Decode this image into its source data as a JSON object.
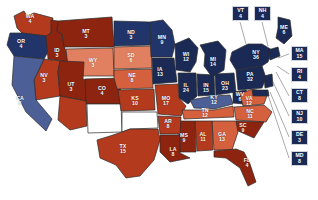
{
  "map": {
    "title": "2004 United States Presidential Election Electoral Map",
    "colors": {
      "dem_deep": "#1b2a55",
      "dem_mid": "#22356b",
      "dem_light": "#4c5f96",
      "rep_deep": "#8c2410",
      "rep_mid": "#b33a1c",
      "rep_light": "#d4603d",
      "rep_pale": "#e08060",
      "background": "#ffffff",
      "border": "#2b2b2b"
    },
    "legend": {
      "dem_label": "Democratic",
      "rep_label": "Republican"
    },
    "states": [
      {
        "abbr": "WA",
        "ev": "4",
        "party": "rep",
        "shade": "rep_mid",
        "x": 30,
        "y": 19
      },
      {
        "abbr": "OR",
        "ev": "4",
        "party": "dem",
        "shade": "dem_mid",
        "x": 21,
        "y": 44
      },
      {
        "abbr": "ID",
        "ev": "3",
        "party": "rep",
        "shade": "rep_deep",
        "x": 57,
        "y": 53
      },
      {
        "abbr": "MT",
        "ev": "3",
        "party": "rep",
        "shade": "rep_deep",
        "x": 86,
        "y": 34
      },
      {
        "abbr": "ND",
        "ev": "3",
        "party": "dem",
        "shade": "dem_mid",
        "x": 131,
        "y": 35
      },
      {
        "abbr": "SD",
        "ev": "6",
        "party": "rep",
        "shade": "rep_pale",
        "x": 131,
        "y": 58
      },
      {
        "abbr": "NE",
        "ev": "8",
        "party": "rep",
        "shade": "rep_light",
        "x": 132,
        "y": 78
      },
      {
        "abbr": "WY",
        "ev": "3",
        "party": "rep",
        "shade": "rep_pale",
        "x": 93,
        "y": 63
      },
      {
        "abbr": "NV",
        "ev": "3",
        "party": "rep",
        "shade": "rep_mid",
        "x": 44,
        "y": 78
      },
      {
        "abbr": "UT",
        "ev": "3",
        "party": "rep",
        "shade": "rep_deep",
        "x": 71,
        "y": 87
      },
      {
        "abbr": "CO",
        "ev": "4",
        "party": "rep",
        "shade": "rep_deep",
        "x": 102,
        "y": 91
      },
      {
        "abbr": "CA",
        "ev": "8",
        "party": "dem",
        "shade": "dem_light",
        "x": 20,
        "y": 101
      },
      {
        "abbr": "KS",
        "ev": "10",
        "party": "rep",
        "shade": "rep_mid",
        "x": 135,
        "y": 101
      },
      {
        "abbr": "MN",
        "ev": "9",
        "party": "dem",
        "shade": "dem_mid",
        "x": 162,
        "y": 40
      },
      {
        "abbr": "IA",
        "ev": "13",
        "party": "dem",
        "shade": "dem_deep",
        "x": 160,
        "y": 72
      },
      {
        "abbr": "WI",
        "ev": "12",
        "party": "dem",
        "shade": "dem_deep",
        "x": 186,
        "y": 57
      },
      {
        "abbr": "MI",
        "ev": "14",
        "party": "dem",
        "shade": "dem_deep",
        "x": 213,
        "y": 62
      },
      {
        "abbr": "IL",
        "ev": "24",
        "party": "dem",
        "shade": "dem_deep",
        "x": 186,
        "y": 88
      },
      {
        "abbr": "IN",
        "ev": "15",
        "party": "dem",
        "shade": "dem_deep",
        "x": 206,
        "y": 88
      },
      {
        "abbr": "OH",
        "ev": "23",
        "party": "dem",
        "shade": "dem_deep",
        "x": 225,
        "y": 86
      },
      {
        "abbr": "MO",
        "ev": "17",
        "party": "rep",
        "shade": "rep_mid",
        "x": 166,
        "y": 101
      },
      {
        "abbr": "KY",
        "ev": "12",
        "party": "dem",
        "shade": "dem_light",
        "x": 214,
        "y": 100
      },
      {
        "abbr": "WV",
        "ev": "6",
        "party": "dem",
        "shade": "dem_deep",
        "x": 240,
        "y": 97
      },
      {
        "abbr": "VA",
        "ev": "12",
        "party": "rep",
        "shade": "rep_light",
        "x": 249,
        "y": 101
      },
      {
        "abbr": "TN",
        "ev": "12",
        "party": "rep",
        "shade": "rep_light",
        "x": 205,
        "y": 113
      },
      {
        "abbr": "NC",
        "ev": "11",
        "party": "rep",
        "shade": "rep_light",
        "x": 250,
        "y": 114
      },
      {
        "abbr": "SC",
        "ev": "9",
        "party": "rep",
        "shade": "rep_deep",
        "x": 243,
        "y": 128
      },
      {
        "abbr": "GA",
        "ev": "13",
        "party": "rep",
        "shade": "rep_light",
        "x": 222,
        "y": 137
      },
      {
        "abbr": "AL",
        "ev": "11",
        "party": "rep",
        "shade": "rep_mid",
        "x": 203,
        "y": 137
      },
      {
        "abbr": "MS",
        "ev": "9",
        "party": "rep",
        "shade": "rep_deep",
        "x": 184,
        "y": 138
      },
      {
        "abbr": "AR",
        "ev": "8",
        "party": "rep",
        "shade": "rep_mid",
        "x": 168,
        "y": 124
      },
      {
        "abbr": "LA",
        "ev": "8",
        "party": "rep",
        "shade": "rep_deep",
        "x": 173,
        "y": 152
      },
      {
        "abbr": "FL",
        "ev": "4",
        "party": "rep",
        "shade": "rep_deep",
        "x": 247,
        "y": 163
      },
      {
        "abbr": "TX",
        "ev": "15",
        "party": "rep",
        "shade": "rep_mid",
        "x": 123,
        "y": 149
      },
      {
        "abbr": "NY",
        "ev": "36",
        "party": "dem",
        "shade": "dem_deep",
        "x": 256,
        "y": 55
      },
      {
        "abbr": "PA",
        "ev": "32",
        "party": "dem",
        "shade": "dem_deep",
        "x": 250,
        "y": 77
      },
      {
        "abbr": "ME",
        "ev": "6",
        "party": "dem",
        "shade": "dem_deep",
        "x": 284,
        "y": 30
      }
    ],
    "box_states": [
      {
        "abbr": "VT",
        "ev": "4",
        "party": "dem",
        "shade": "dem_deep",
        "x": 232,
        "y": 6
      },
      {
        "abbr": "NH",
        "ev": "4",
        "party": "dem",
        "shade": "dem_deep",
        "x": 254,
        "y": 6
      },
      {
        "abbr": "MA",
        "ev": "15",
        "party": "dem",
        "shade": "dem_deep",
        "x": 291,
        "y": 46
      },
      {
        "abbr": "RI",
        "ev": "4",
        "party": "dem",
        "shade": "dem_deep",
        "x": 291,
        "y": 67
      },
      {
        "abbr": "CT",
        "ev": "8",
        "party": "dem",
        "shade": "dem_deep",
        "x": 291,
        "y": 88
      },
      {
        "abbr": "NJ",
        "ev": "10",
        "party": "dem",
        "shade": "dem_deep",
        "x": 291,
        "y": 109
      },
      {
        "abbr": "DE",
        "ev": "3",
        "party": "dem",
        "shade": "dem_deep",
        "x": 291,
        "y": 130
      },
      {
        "abbr": "MD",
        "ev": "8",
        "party": "dem",
        "shade": "dem_deep",
        "x": 291,
        "y": 151
      }
    ]
  }
}
